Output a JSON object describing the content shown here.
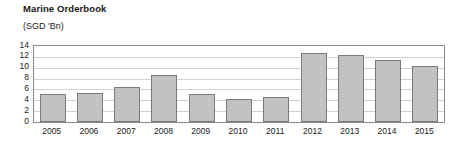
{
  "chart_data": {
    "type": "bar",
    "title": "Marine Orderbook",
    "subtitle": "(SGD 'Bn)",
    "ylabel": "(SGD 'Bn)",
    "xlabel": "",
    "categories": [
      "2005",
      "2006",
      "2007",
      "2008",
      "2009",
      "2010",
      "2011",
      "2012",
      "2013",
      "2014",
      "2015"
    ],
    "values": [
      5.2,
      5.3,
      6.5,
      8.6,
      5.2,
      4.2,
      4.6,
      12.7,
      12.4,
      11.4,
      10.4
    ],
    "yticks": [
      0,
      2,
      4,
      6,
      8,
      10,
      12,
      14
    ],
    "ytick_labels": [
      "0",
      "2",
      "4",
      "6",
      "8",
      "10",
      "12",
      "14"
    ],
    "ylim": [
      0,
      14
    ],
    "grid": true,
    "legend": null,
    "bar_color": "#c2c2c2",
    "bar_border_color": "#7a7a7a",
    "gridline_color": "#d2d2d2",
    "frame_color": "#8c8c8c",
    "text_color": "#1a1a1a"
  }
}
